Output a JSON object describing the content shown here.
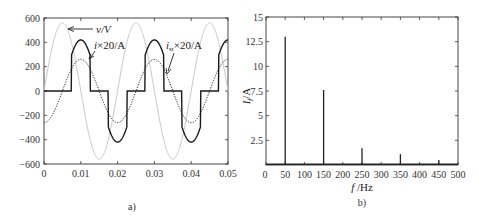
{
  "chart_data": [
    {
      "panel": "a)",
      "type": "line",
      "title": "",
      "xlabel": "",
      "ylabel": "",
      "xlim": [
        0,
        0.05
      ],
      "ylim": [
        -600,
        600
      ],
      "x_ticks": [
        "0",
        "0.01",
        "0.02",
        "0.03",
        "0.04",
        "0.05"
      ],
      "y_ticks": [
        "600",
        "400",
        "200",
        "0",
        "-200",
        "-400",
        "-600"
      ],
      "grid": false,
      "series": [
        {
          "name": "v/V",
          "style": "light gray solid",
          "description": "sinusoid, amplitude ~560, 50 Hz, v = 560·sin(2π·50·t)",
          "x": [
            0,
            0.005,
            0.01,
            0.015,
            0.02,
            0.025,
            0.03,
            0.035,
            0.04,
            0.045,
            0.05
          ],
          "values": [
            0,
            560,
            0,
            -560,
            0,
            560,
            0,
            -560,
            0,
            560,
            0
          ]
        },
        {
          "name": "i×20/A",
          "style": "black solid",
          "description": "pulsed current, zero except |t-0.01k|<0.0025 where it follows -420·cos(2π·50·t); jumps ~±300 at edges, peaks ±420",
          "x": [
            0,
            0.0075,
            0.0075,
            0.01,
            0.0125,
            0.0125,
            0.0175,
            0.0175,
            0.02,
            0.0225,
            0.0225,
            0.0275,
            0.0275,
            0.03,
            0.0325,
            0.0325,
            0.0375,
            0.0375,
            0.04,
            0.0425,
            0.0425,
            0.0475,
            0.0475,
            0.05
          ],
          "values": [
            0,
            0,
            297,
            420,
            297,
            0,
            0,
            -297,
            -420,
            -297,
            0,
            0,
            297,
            420,
            297,
            0,
            0,
            -297,
            -420,
            -297,
            0,
            0,
            297,
            420
          ]
        },
        {
          "name": "i_st×20/A",
          "style": "black dotted",
          "description": "sinusoid, amplitude ~260, i_st = -260·cos(2π·50·t)",
          "x": [
            0,
            0.005,
            0.01,
            0.015,
            0.02,
            0.025,
            0.03,
            0.035,
            0.04,
            0.045,
            0.05
          ],
          "values": [
            -260,
            0,
            260,
            0,
            -260,
            0,
            260,
            0,
            -260,
            0,
            260
          ]
        }
      ],
      "annotations": [
        {
          "text": "v/V",
          "arrow": true
        },
        {
          "text": "i×20/A",
          "arrow": true
        },
        {
          "text": "i_st×20/A",
          "arrow": true
        }
      ]
    },
    {
      "panel": "b)",
      "type": "bar",
      "title": "",
      "xlabel": "f /Hz",
      "ylabel": "I_f/A",
      "xlim": [
        0,
        500
      ],
      "ylim": [
        0,
        15
      ],
      "x_ticks": [
        "0",
        "50",
        "100",
        "150",
        "200",
        "250",
        "300",
        "350",
        "400",
        "450",
        "500"
      ],
      "y_ticks": [
        "15",
        "12.5",
        "10",
        "7.5",
        "5",
        "2.5"
      ],
      "grid": false,
      "categories": [
        50,
        150,
        250,
        350,
        450
      ],
      "values": [
        13.0,
        7.6,
        1.7,
        1.1,
        0.5
      ]
    }
  ],
  "panels": {
    "a": {
      "caption": "a)",
      "y_ticks": [
        "600",
        "400",
        "200",
        "0",
        "−200",
        "−400",
        "−600"
      ],
      "x_ticks": [
        "0",
        "0.01",
        "0.02",
        "0.03",
        "0.04",
        "0.05"
      ],
      "legend": {
        "v": "v/V",
        "i_main": "i",
        "i_suffix": "×20/A",
        "ist_main": "i",
        "ist_sub": "st",
        "ist_suffix": "×20/A"
      }
    },
    "b": {
      "caption": "b)",
      "y_ticks": [
        "15",
        "12.5",
        "10",
        "7.5",
        "5",
        "2.5"
      ],
      "x_ticks": [
        "0",
        "50",
        "100",
        "150",
        "200",
        "250",
        "300",
        "350",
        "400",
        "450",
        "500"
      ],
      "xlabel_main": "f",
      "xlabel_unit": " /Hz",
      "ylabel_main": "I",
      "ylabel_sub": "f",
      "ylabel_unit": "/A"
    }
  },
  "colors": {
    "voltage": "#c8c8c8",
    "current": "#1a1a1a",
    "axis": "#333333"
  }
}
